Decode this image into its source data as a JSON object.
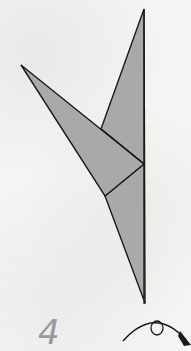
{
  "diagram": {
    "type": "origami-instruction-step",
    "step_number": "4",
    "symbols": [
      "turn-over-arrow"
    ],
    "colors": {
      "paper_fill": "#a9a9a9",
      "outline": "#1a1a1a",
      "step_number": "#9a9a9a",
      "background": "#f5f5f3"
    }
  }
}
